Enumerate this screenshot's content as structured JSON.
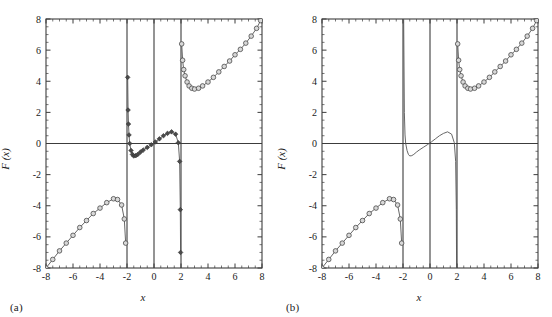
{
  "figure": {
    "panels": [
      {
        "label": "(a)",
        "xlabel": "x",
        "ylabel": "F (x)",
        "has_markers_center": true
      },
      {
        "label": "(b)",
        "xlabel": "x",
        "ylabel": "F (x)",
        "has_markers_center": false
      }
    ]
  },
  "chart_data": [
    {
      "type": "line",
      "panel": "(a)",
      "title": "",
      "xlabel": "x",
      "ylabel": "F (x)",
      "xlim": [
        -8,
        8
      ],
      "ylim": [
        -8,
        8
      ],
      "xticks": [
        -8,
        -6,
        -4,
        -2,
        0,
        2,
        4,
        6,
        8
      ],
      "xticklabels": [
        "-8",
        "-6",
        "-4",
        "-2",
        "0",
        "2",
        "4",
        "6",
        "8"
      ],
      "yticks": [
        -8,
        -6,
        -4,
        -2,
        0,
        2,
        4,
        6,
        8
      ],
      "yticklabels": [
        "-8",
        "-6",
        "-4",
        "-2",
        "0",
        "2",
        "4",
        "6",
        "8"
      ],
      "minor_tick_step": 0.5,
      "grid": false,
      "legend": "none",
      "asymptotes": [
        -2.0,
        2.0
      ],
      "series": [
        {
          "name": "left-branch",
          "marker": "open-circle",
          "x": [
            -8.0,
            -7.5,
            -7.0,
            -6.5,
            -6.0,
            -5.5,
            -5.0,
            -4.5,
            -4.0,
            -3.5,
            -3.0,
            -2.7,
            -2.4,
            -2.2,
            -2.1
          ],
          "y": [
            -8.0,
            -7.45,
            -6.9,
            -6.4,
            -5.9,
            -5.4,
            -4.95,
            -4.5,
            -4.15,
            -3.8,
            -3.55,
            -3.6,
            -3.95,
            -4.85,
            -6.4
          ]
        },
        {
          "name": "center-branch",
          "marker": "filled-diamond",
          "x": [
            -1.95,
            -1.92,
            -1.89,
            -1.85,
            -1.8,
            -1.7,
            -1.6,
            -1.5,
            -1.35,
            -1.2,
            -1.0,
            -0.8,
            -0.5,
            -0.2,
            0.1,
            0.4,
            0.7,
            1.0,
            1.3,
            1.6,
            1.8,
            1.9,
            1.95,
            1.97
          ],
          "y": [
            4.25,
            2.15,
            1.25,
            0.55,
            0.0,
            -0.45,
            -0.7,
            -0.8,
            -0.78,
            -0.7,
            -0.55,
            -0.42,
            -0.25,
            -0.08,
            0.1,
            0.3,
            0.5,
            0.65,
            0.75,
            0.6,
            0.05,
            -1.15,
            -4.25,
            -7.0
          ]
        },
        {
          "name": "right-branch",
          "marker": "open-circle",
          "x": [
            2.05,
            2.12,
            2.2,
            2.3,
            2.45,
            2.6,
            2.8,
            3.0,
            3.3,
            3.6,
            4.0,
            4.4,
            4.8,
            5.2,
            5.6,
            6.0,
            6.4,
            6.8,
            7.2,
            7.6,
            7.9
          ],
          "y": [
            6.4,
            5.35,
            4.75,
            4.35,
            3.95,
            3.7,
            3.55,
            3.5,
            3.55,
            3.7,
            3.95,
            4.25,
            4.6,
            4.95,
            5.3,
            5.7,
            6.05,
            6.45,
            6.9,
            7.4,
            7.9
          ]
        }
      ]
    },
    {
      "type": "line",
      "panel": "(b)",
      "title": "",
      "xlabel": "x",
      "ylabel": "F (x)",
      "xlim": [
        -8,
        8
      ],
      "ylim": [
        -8,
        8
      ],
      "xticks": [
        -8,
        -6,
        -4,
        -2,
        0,
        2,
        4,
        6,
        8
      ],
      "xticklabels": [
        "-8",
        "-6",
        "-4",
        "-2",
        "0",
        "2",
        "4",
        "6",
        "8"
      ],
      "yticks": [
        -8,
        -6,
        -4,
        -2,
        0,
        2,
        4,
        6,
        8
      ],
      "yticklabels": [
        "-8",
        "-6",
        "-4",
        "-2",
        "0",
        "2",
        "4",
        "6",
        "8"
      ],
      "minor_tick_step": 0.5,
      "grid": false,
      "legend": "none",
      "asymptotes": [
        -2.0,
        2.0
      ],
      "series": [
        {
          "name": "left-branch",
          "marker": "open-circle",
          "x": [
            -8.0,
            -7.5,
            -7.0,
            -6.5,
            -6.0,
            -5.5,
            -5.0,
            -4.5,
            -4.0,
            -3.5,
            -3.0,
            -2.7,
            -2.4,
            -2.2,
            -2.1
          ],
          "y": [
            -8.0,
            -7.45,
            -6.9,
            -6.4,
            -5.9,
            -5.4,
            -4.95,
            -4.5,
            -4.15,
            -3.8,
            -3.55,
            -3.6,
            -3.95,
            -4.85,
            -6.4
          ]
        },
        {
          "name": "center-branch",
          "marker": "none",
          "x": [
            -1.95,
            -1.9,
            -1.85,
            -1.8,
            -1.7,
            -1.6,
            -1.5,
            -1.35,
            -1.2,
            -1.0,
            -0.8,
            -0.5,
            -0.2,
            0.1,
            0.4,
            0.7,
            1.0,
            1.3,
            1.6,
            1.8,
            1.9,
            1.95,
            1.97
          ],
          "y": [
            8.0,
            2.0,
            0.55,
            0.0,
            -0.45,
            -0.7,
            -0.8,
            -0.78,
            -0.7,
            -0.55,
            -0.42,
            -0.25,
            -0.08,
            0.1,
            0.3,
            0.5,
            0.65,
            0.75,
            0.6,
            0.05,
            -1.15,
            -4.25,
            -8.0
          ]
        },
        {
          "name": "right-branch",
          "marker": "open-circle",
          "x": [
            2.05,
            2.12,
            2.2,
            2.3,
            2.45,
            2.6,
            2.8,
            3.0,
            3.3,
            3.6,
            4.0,
            4.4,
            4.8,
            5.2,
            5.6,
            6.0,
            6.4,
            6.8,
            7.2,
            7.6,
            7.9
          ],
          "y": [
            6.4,
            5.35,
            4.75,
            4.35,
            3.95,
            3.7,
            3.55,
            3.5,
            3.55,
            3.7,
            3.95,
            4.25,
            4.6,
            4.95,
            5.3,
            5.7,
            6.05,
            6.45,
            6.9,
            7.4,
            7.9
          ]
        }
      ]
    }
  ],
  "colors": {
    "background": "#ffffff",
    "axis": "#3c3c3c",
    "curve": "#555555",
    "marker_edge": "#4a4a4a",
    "marker_face": "#d8d8d8",
    "text": "#1a1a1a"
  }
}
